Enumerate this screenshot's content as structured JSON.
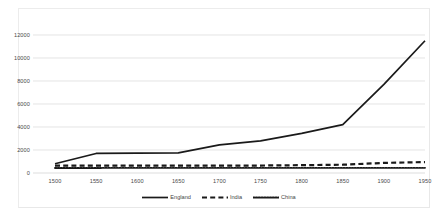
{
  "chart_data": {
    "type": "line",
    "title": "",
    "xlabel": "",
    "ylabel": "",
    "x": [
      1500,
      1550,
      1600,
      1650,
      1700,
      1750,
      1800,
      1850,
      1900,
      1950
    ],
    "xlim": [
      1500,
      1950
    ],
    "ylim": [
      0,
      13000
    ],
    "yticks": [
      0,
      2000,
      4000,
      6000,
      8000,
      10000,
      12000
    ],
    "xticks": [
      1500,
      1550,
      1600,
      1650,
      1700,
      1750,
      1800,
      1850,
      1900,
      1950
    ],
    "grid": "horizontal",
    "legend_position": "bottom",
    "series": [
      {
        "name": "England",
        "style": "solid",
        "color": "#1a1a1a",
        "values": [
          800,
          1700,
          1720,
          1750,
          2450,
          2800,
          3450,
          4200,
          7700,
          11500
        ]
      },
      {
        "name": "India",
        "style": "dashed",
        "color": "#1a1a1a",
        "values": [
          650,
          650,
          650,
          650,
          650,
          650,
          680,
          720,
          880,
          950
        ]
      },
      {
        "name": "China",
        "style": "dotted",
        "color": "#1a1a1a",
        "values": [
          430,
          440,
          450,
          450,
          450,
          450,
          450,
          450,
          450,
          450
        ]
      }
    ]
  },
  "axis": {
    "y_tick_labels": [
      "0",
      "2000",
      "4000",
      "6000",
      "8000",
      "10000",
      "12000"
    ],
    "x_tick_labels": [
      "1500",
      "1550",
      "1600",
      "1650",
      "1700",
      "1750",
      "1800",
      "1850",
      "1900",
      "1950"
    ]
  },
  "legend": {
    "items": [
      {
        "label": "England",
        "style": "solid"
      },
      {
        "label": "India",
        "style": "dashed"
      },
      {
        "label": "China",
        "style": "dotted"
      }
    ]
  },
  "colors": {
    "series_line": "#1a1a1a",
    "gridline": "#d9d9d9",
    "axis_text": "#4a4a4a",
    "frame": "#e8e8e8",
    "background": "#ffffff"
  }
}
